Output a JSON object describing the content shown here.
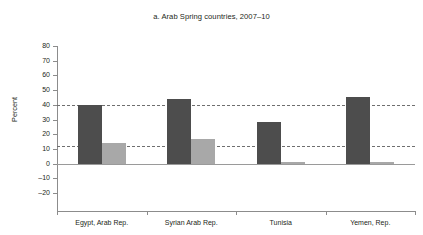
{
  "chart_data": {
    "type": "bar",
    "title": "a. Arab Spring countries, 2007–10",
    "xlabel": "",
    "ylabel": "Percent",
    "ylim": [
      -20,
      80
    ],
    "ytick_labels": [
      "80",
      "70",
      "60",
      "50",
      "40",
      "30",
      "20",
      "10",
      "0",
      "–10",
      "–20"
    ],
    "ytick_values": [
      80,
      70,
      60,
      50,
      40,
      30,
      20,
      10,
      0,
      -10,
      -20
    ],
    "grid": false,
    "legend": "none",
    "categories": [
      "Egypt, Arab Rep.",
      "Syrian Arab Rep.",
      "Tunisia",
      "Yemen, Rep."
    ],
    "series": [
      {
        "name": "series-1",
        "color": "#4d4d4d",
        "values": [
          40,
          44,
          28,
          45
        ]
      },
      {
        "name": "series-2",
        "color": "#a8a8a8",
        "values": [
          14,
          17,
          1,
          1
        ]
      }
    ],
    "reference_lines": [
      {
        "name": "upper-reference",
        "value": 40,
        "style": "dashed"
      },
      {
        "name": "lower-reference",
        "value": 12,
        "style": "dashed"
      }
    ],
    "zero_line": 0,
    "colors": {
      "series_1": "#4d4d4d",
      "series_2": "#a8a8a8",
      "axis": "#8c8c8c",
      "reference": "#6f6f6f",
      "text": "#231f20",
      "background": "#ffffff"
    }
  }
}
